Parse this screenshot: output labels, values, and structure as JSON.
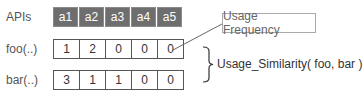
{
  "apis_label": "APIs",
  "columns": [
    "a1",
    "a2",
    "a3",
    "a4",
    "a5"
  ],
  "rows": [
    {
      "label": "foo(..)",
      "values": [
        "1",
        "2",
        "0",
        "0",
        "0"
      ]
    },
    {
      "label": "bar(..)",
      "values": [
        "3",
        "1",
        "1",
        "0",
        "0"
      ]
    }
  ],
  "callout": {
    "text": "Usage Frequency"
  },
  "similarity": {
    "text": "Usage_Similarity( foo, bar )"
  },
  "colors": {
    "header_bg": "#6e6e6e",
    "header_text": "#ffffff",
    "border": "#555555",
    "callout_border": "#aaaaaa"
  }
}
